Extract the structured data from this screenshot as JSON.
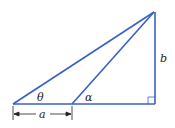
{
  "diagram": {
    "type": "right-triangle-geometry",
    "labels": {
      "theta": "θ",
      "alpha": "α",
      "a": "a",
      "b": "b"
    },
    "colors": {
      "line": "#3a5fc8",
      "text": "#222222",
      "dimension": "#222222"
    }
  }
}
